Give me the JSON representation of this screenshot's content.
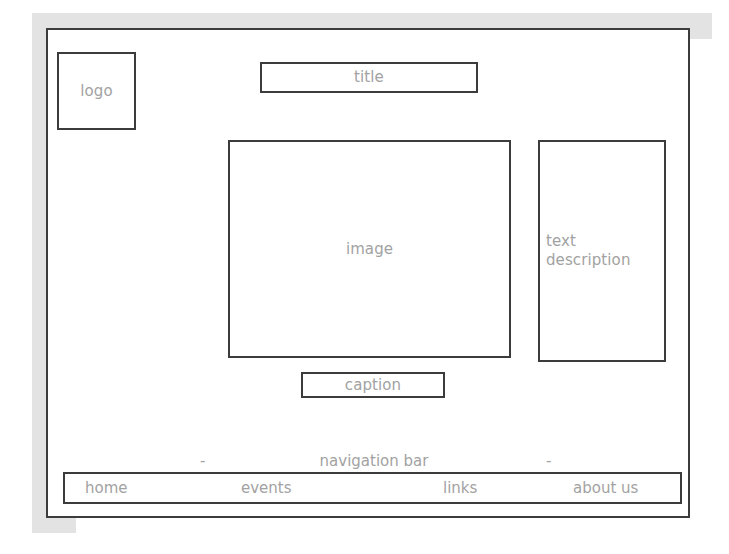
{
  "wireframe": {
    "title": "Web page layout wireframe",
    "colors": {
      "border": "#3c3c3c",
      "label_text": "#a2a2a2",
      "paper_band": "#e3e3e3",
      "page_background": "#ffffff"
    },
    "blocks": {
      "logo": "logo",
      "title": "title",
      "image": "image",
      "text_description": "text\ndescription",
      "caption": "caption"
    },
    "navigation": {
      "annotation_label": "navigation bar",
      "dash_left": "-",
      "dash_right": "-",
      "items": [
        {
          "label": "home"
        },
        {
          "label": "events"
        },
        {
          "label": "links"
        },
        {
          "label": "about us"
        }
      ]
    }
  }
}
